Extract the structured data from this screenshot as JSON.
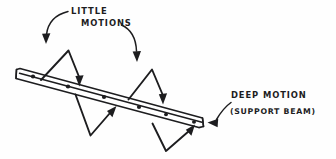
{
  "canvas": {
    "width": 336,
    "height": 159,
    "background_color": "#fefefe",
    "ink_color": "#1d1d1f",
    "style": "hand-drawn pen sketch"
  },
  "diagram": {
    "title_text": "",
    "labels": {
      "little_motions_line1": "LITTLE",
      "little_motions_line2": "MOTIONS",
      "deep_motion_line1": "DEEP MOTION",
      "deep_motion_line2": "(SUPPORT BEAM)"
    },
    "beam": {
      "name": "support-beam",
      "orientation": "tilted down to the right",
      "dot_count": 6,
      "dots": [
        {
          "x": 33,
          "y": 78
        },
        {
          "x": 68,
          "y": 88
        },
        {
          "x": 104,
          "y": 98
        },
        {
          "x": 139,
          "y": 107
        },
        {
          "x": 166,
          "y": 113
        },
        {
          "x": 192,
          "y": 120
        }
      ]
    },
    "motion_arrows": {
      "upper_count": 2,
      "lower_count": 2,
      "upper_description": "zigzag peaks above the beam with arrows pointing down onto the beam",
      "lower_description": "zigzag valleys below the beam with arrows pointing up onto the beam"
    },
    "leader_arrows": {
      "little_motions_left": "curved arrow from LITTLE label down-left to first zigzag",
      "little_motions_right": "curved arrow from MOTIONS label down-right to second zigzag",
      "deep_motion": "curved arrow from DEEP MOTION label left to beam right end"
    }
  }
}
